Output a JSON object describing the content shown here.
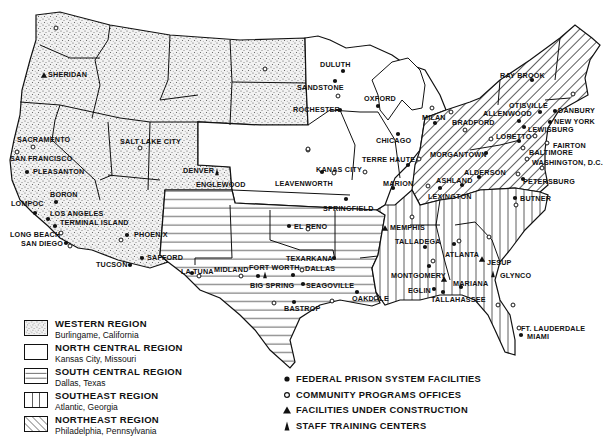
{
  "map": {
    "title": "Federal Prison System Regions and Facilities",
    "colors": {
      "ink": "#111111",
      "paper": "#ffffff",
      "stipple": "#555555"
    }
  },
  "legend": {
    "regions": [
      {
        "name": "WESTERN REGION",
        "hq": "Burlingame, California",
        "pattern": "stipple"
      },
      {
        "name": "NORTH CENTRAL REGION",
        "hq": "Kansas City, Missouri",
        "pattern": "blank"
      },
      {
        "name": "SOUTH CENTRAL REGION",
        "hq": "Dallas, Texas",
        "pattern": "horizontal-lines"
      },
      {
        "name": "SOUTHEAST REGION",
        "hq": "Atlantic, Georgia",
        "pattern": "vertical-lines"
      },
      {
        "name": "NORTHEAST REGION",
        "hq": "Philadelphia, Pennsylvania",
        "pattern": "diagonal-lines"
      }
    ],
    "symbols": [
      {
        "icon": "filled-circle-icon",
        "label": "FEDERAL PRISON SYSTEM FACILITIES"
      },
      {
        "icon": "open-circle-icon",
        "label": "COMMUNITY PROGRAMS OFFICES"
      },
      {
        "icon": "triangle-icon",
        "label": "FACILITIES UNDER CONSTRUCTION"
      },
      {
        "icon": "training-center-icon",
        "label": "STAFF TRAINING CENTERS"
      }
    ]
  },
  "places": [
    {
      "name": "SHERIDAN",
      "x": 48,
      "y": 71
    },
    {
      "name": "SACRAMENTO",
      "x": 17,
      "y": 136
    },
    {
      "name": "SAN FRANCISCO",
      "x": 10,
      "y": 155
    },
    {
      "name": "PLEASANTON",
      "x": 33,
      "y": 168
    },
    {
      "name": "BORON",
      "x": 50,
      "y": 191
    },
    {
      "name": "LOMPOC",
      "x": 11,
      "y": 200
    },
    {
      "name": "LOS ANGELES",
      "x": 50,
      "y": 210
    },
    {
      "name": "TERMINAL ISLAND",
      "x": 60,
      "y": 219
    },
    {
      "name": "LONG BEACH",
      "x": 10,
      "y": 231
    },
    {
      "name": "SAN DIEGO",
      "x": 21,
      "y": 240
    },
    {
      "name": "PHOENIX",
      "x": 134,
      "y": 231
    },
    {
      "name": "SAFFORD",
      "x": 147,
      "y": 254
    },
    {
      "name": "TUCSON",
      "x": 96,
      "y": 261
    },
    {
      "name": "SALT LAKE CITY",
      "x": 120,
      "y": 138
    },
    {
      "name": "DENVER",
      "x": 183,
      "y": 167
    },
    {
      "name": "ENGLEWOOD",
      "x": 196,
      "y": 181
    },
    {
      "name": "LA TUNA",
      "x": 181,
      "y": 268
    },
    {
      "name": "MIDLAND",
      "x": 214,
      "y": 266
    },
    {
      "name": "FORT WORTH",
      "x": 249,
      "y": 264
    },
    {
      "name": "DALLAS",
      "x": 305,
      "y": 265
    },
    {
      "name": "BIG SPRING",
      "x": 250,
      "y": 282
    },
    {
      "name": "SEAGOVILLE",
      "x": 306,
      "y": 282
    },
    {
      "name": "TEXARKANA",
      "x": 286,
      "y": 255
    },
    {
      "name": "EL RENO",
      "x": 294,
      "y": 223
    },
    {
      "name": "BASTROP",
      "x": 284,
      "y": 305
    },
    {
      "name": "OAKDALE",
      "x": 352,
      "y": 295
    },
    {
      "name": "KANAS CITY",
      "x": 316,
      "y": 166
    },
    {
      "name": "LEAVENWORTH",
      "x": 275,
      "y": 180
    },
    {
      "name": "SPRINGFIELD",
      "x": 323,
      "y": 205
    },
    {
      "name": "DULUTH",
      "x": 320,
      "y": 61
    },
    {
      "name": "SANDSTONE",
      "x": 297,
      "y": 84
    },
    {
      "name": "ROCHESTER",
      "x": 293,
      "y": 106
    },
    {
      "name": "OXFORD",
      "x": 364,
      "y": 95
    },
    {
      "name": "CHICAGO",
      "x": 376,
      "y": 137
    },
    {
      "name": "TERRE HAUTE",
      "x": 362,
      "y": 156
    },
    {
      "name": "MARION",
      "x": 383,
      "y": 180
    },
    {
      "name": "MILAN",
      "x": 422,
      "y": 114
    },
    {
      "name": "BRADFORD",
      "x": 452,
      "y": 119
    },
    {
      "name": "RAY BROOK",
      "x": 500,
      "y": 72
    },
    {
      "name": "OTISVILLE",
      "x": 509,
      "y": 102
    },
    {
      "name": "DANBURY",
      "x": 558,
      "y": 107
    },
    {
      "name": "ALLENWOOD",
      "x": 483,
      "y": 110
    },
    {
      "name": "NEW YORK",
      "x": 554,
      "y": 118
    },
    {
      "name": "LEWISBURG",
      "x": 528,
      "y": 126
    },
    {
      "name": "LORETTO",
      "x": 496,
      "y": 133
    },
    {
      "name": "FAIRTON",
      "x": 553,
      "y": 142
    },
    {
      "name": "BALTIMORE",
      "x": 529,
      "y": 149
    },
    {
      "name": "MORGANTOWN",
      "x": 430,
      "y": 151
    },
    {
      "name": "WASHINGTON, D.C.",
      "x": 532,
      "y": 159
    },
    {
      "name": "ALDERSON",
      "x": 464,
      "y": 169
    },
    {
      "name": "ASHLAND",
      "x": 436,
      "y": 177
    },
    {
      "name": "PETERSBURG",
      "x": 523,
      "y": 178
    },
    {
      "name": "LEXINGTON",
      "x": 428,
      "y": 193
    },
    {
      "name": "BUTNER",
      "x": 520,
      "y": 195
    },
    {
      "name": "MEMPHIS",
      "x": 390,
      "y": 224
    },
    {
      "name": "TALLADEGA",
      "x": 395,
      "y": 238
    },
    {
      "name": "ATLANTA",
      "x": 445,
      "y": 251
    },
    {
      "name": "JESUP",
      "x": 487,
      "y": 259
    },
    {
      "name": "MONTGOMERY",
      "x": 391,
      "y": 272
    },
    {
      "name": "GLYNCO",
      "x": 500,
      "y": 272
    },
    {
      "name": "MARIANA",
      "x": 453,
      "y": 280
    },
    {
      "name": "EGLIN",
      "x": 408,
      "y": 287
    },
    {
      "name": "TALLAHASSEE",
      "x": 431,
      "y": 296
    },
    {
      "name": "FT. LAUDERDALE",
      "x": 521,
      "y": 325
    },
    {
      "name": "MIAMI",
      "x": 527,
      "y": 333
    }
  ],
  "markers": [
    {
      "type": "construction",
      "x": 44,
      "y": 75
    },
    {
      "type": "office",
      "x": 56,
      "y": 28
    },
    {
      "type": "office",
      "x": 33,
      "y": 147
    },
    {
      "type": "office",
      "x": 17,
      "y": 152
    },
    {
      "type": "facility",
      "x": 27,
      "y": 172
    },
    {
      "type": "facility",
      "x": 56,
      "y": 202
    },
    {
      "type": "facility",
      "x": 35,
      "y": 213
    },
    {
      "type": "facility",
      "x": 48,
      "y": 219
    },
    {
      "type": "facility",
      "x": 55,
      "y": 226
    },
    {
      "type": "office",
      "x": 61,
      "y": 233
    },
    {
      "type": "facility",
      "x": 66,
      "y": 243
    },
    {
      "type": "office",
      "x": 70,
      "y": 246
    },
    {
      "type": "facility",
      "x": 127,
      "y": 235
    },
    {
      "type": "office",
      "x": 121,
      "y": 240
    },
    {
      "type": "facility",
      "x": 142,
      "y": 258
    },
    {
      "type": "facility",
      "x": 130,
      "y": 265
    },
    {
      "type": "office",
      "x": 140,
      "y": 148
    },
    {
      "type": "office",
      "x": 265,
      "y": 69
    },
    {
      "type": "training",
      "x": 217,
      "y": 172
    },
    {
      "type": "facility",
      "x": 192,
      "y": 273
    },
    {
      "type": "office",
      "x": 199,
      "y": 276
    },
    {
      "type": "office",
      "x": 241,
      "y": 276
    },
    {
      "type": "facility",
      "x": 258,
      "y": 276
    },
    {
      "type": "training",
      "x": 265,
      "y": 275
    },
    {
      "type": "facility",
      "x": 293,
      "y": 275
    },
    {
      "type": "office",
      "x": 302,
      "y": 270
    },
    {
      "type": "facility",
      "x": 303,
      "y": 284
    },
    {
      "type": "facility",
      "x": 334,
      "y": 258
    },
    {
      "type": "facility",
      "x": 289,
      "y": 226
    },
    {
      "type": "office",
      "x": 274,
      "y": 303
    },
    {
      "type": "facility",
      "x": 294,
      "y": 302
    },
    {
      "type": "office",
      "x": 332,
      "y": 301
    },
    {
      "type": "facility",
      "x": 357,
      "y": 292
    },
    {
      "type": "office",
      "x": 376,
      "y": 298
    },
    {
      "type": "office",
      "x": 308,
      "y": 150
    },
    {
      "type": "facility",
      "x": 322,
      "y": 172
    },
    {
      "type": "office",
      "x": 334,
      "y": 173
    },
    {
      "type": "office",
      "x": 365,
      "y": 172
    },
    {
      "type": "facility",
      "x": 346,
      "y": 199
    },
    {
      "type": "office",
      "x": 308,
      "y": 229
    },
    {
      "type": "facility",
      "x": 343,
      "y": 71
    },
    {
      "type": "facility",
      "x": 335,
      "y": 81
    },
    {
      "type": "office",
      "x": 338,
      "y": 96
    },
    {
      "type": "facility",
      "x": 340,
      "y": 110
    },
    {
      "type": "facility",
      "x": 378,
      "y": 106
    },
    {
      "type": "office",
      "x": 308,
      "y": 149
    },
    {
      "type": "facility",
      "x": 398,
      "y": 134
    },
    {
      "type": "office",
      "x": 419,
      "y": 159
    },
    {
      "type": "facility",
      "x": 408,
      "y": 165
    },
    {
      "type": "office",
      "x": 432,
      "y": 108
    },
    {
      "type": "facility",
      "x": 393,
      "y": 188
    },
    {
      "type": "facility",
      "x": 435,
      "y": 123
    },
    {
      "type": "office",
      "x": 451,
      "y": 112
    },
    {
      "type": "office",
      "x": 465,
      "y": 130
    },
    {
      "type": "facility",
      "x": 532,
      "y": 80
    },
    {
      "type": "office",
      "x": 573,
      "y": 94
    },
    {
      "type": "facility",
      "x": 540,
      "y": 112
    },
    {
      "type": "facility",
      "x": 555,
      "y": 111
    },
    {
      "type": "facility",
      "x": 550,
      "y": 122
    },
    {
      "type": "facility",
      "x": 519,
      "y": 121
    },
    {
      "type": "facility",
      "x": 524,
      "y": 127
    },
    {
      "type": "facility",
      "x": 519,
      "y": 141
    },
    {
      "type": "office",
      "x": 491,
      "y": 139
    },
    {
      "type": "office",
      "x": 535,
      "y": 136
    },
    {
      "type": "office",
      "x": 547,
      "y": 143
    },
    {
      "type": "office",
      "x": 523,
      "y": 148
    },
    {
      "type": "facility",
      "x": 486,
      "y": 153
    },
    {
      "type": "office",
      "x": 527,
      "y": 159
    },
    {
      "type": "office",
      "x": 542,
      "y": 168
    },
    {
      "type": "office",
      "x": 518,
      "y": 174
    },
    {
      "type": "facility",
      "x": 523,
      "y": 179
    },
    {
      "type": "facility",
      "x": 479,
      "y": 177
    },
    {
      "type": "facility",
      "x": 462,
      "y": 185
    },
    {
      "type": "facility",
      "x": 440,
      "y": 188
    },
    {
      "type": "office",
      "x": 428,
      "y": 186
    },
    {
      "type": "facility",
      "x": 515,
      "y": 198
    },
    {
      "type": "office",
      "x": 516,
      "y": 205
    },
    {
      "type": "office",
      "x": 412,
      "y": 217
    },
    {
      "type": "construction",
      "x": 385,
      "y": 228
    },
    {
      "type": "facility",
      "x": 425,
      "y": 247
    },
    {
      "type": "facility",
      "x": 454,
      "y": 244
    },
    {
      "type": "office",
      "x": 459,
      "y": 241
    },
    {
      "type": "office",
      "x": 489,
      "y": 237
    },
    {
      "type": "construction",
      "x": 482,
      "y": 259
    },
    {
      "type": "facility",
      "x": 429,
      "y": 266
    },
    {
      "type": "office",
      "x": 433,
      "y": 261
    },
    {
      "type": "training",
      "x": 493,
      "y": 274
    },
    {
      "type": "construction",
      "x": 444,
      "y": 279
    },
    {
      "type": "facility",
      "x": 434,
      "y": 289
    },
    {
      "type": "facility",
      "x": 443,
      "y": 292
    },
    {
      "type": "facility",
      "x": 461,
      "y": 287
    },
    {
      "type": "office",
      "x": 498,
      "y": 305
    },
    {
      "type": "office",
      "x": 519,
      "y": 328
    },
    {
      "type": "facility",
      "x": 521,
      "y": 335
    },
    {
      "type": "office",
      "x": 513,
      "y": 305
    }
  ]
}
